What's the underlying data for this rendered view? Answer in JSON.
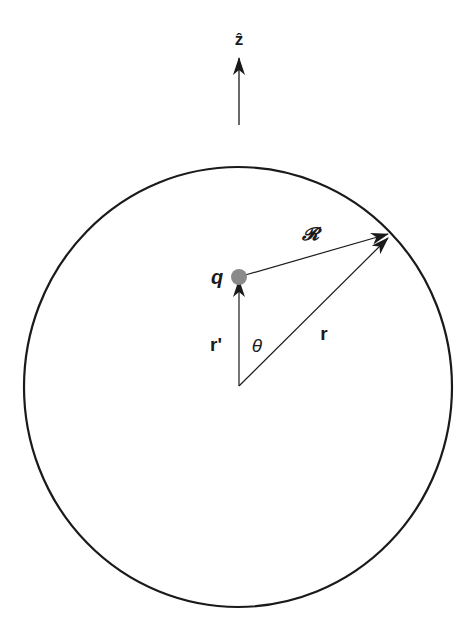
{
  "diagram": {
    "type": "geometry-vector-diagram",
    "colors": {
      "stroke": "#1a1a1a",
      "charge": "#8a8a8a",
      "background": "#ffffff"
    },
    "labels": {
      "z_axis": "ẑ",
      "charge": "q",
      "separation_vector": "𝓡",
      "source_vector": "r'",
      "field_vector": "r",
      "angle": "θ"
    },
    "elements": {
      "sphere": {
        "shape": "circle",
        "description": "spherical surface centered at origin"
      },
      "z_axis_arrow": {
        "direction": "up"
      },
      "vector_r_prime": {
        "from": "origin",
        "to": "charge q"
      },
      "vector_r": {
        "from": "origin",
        "to": "point on sphere"
      },
      "vector_script_r": {
        "from": "charge q",
        "to": "point on sphere"
      }
    }
  }
}
